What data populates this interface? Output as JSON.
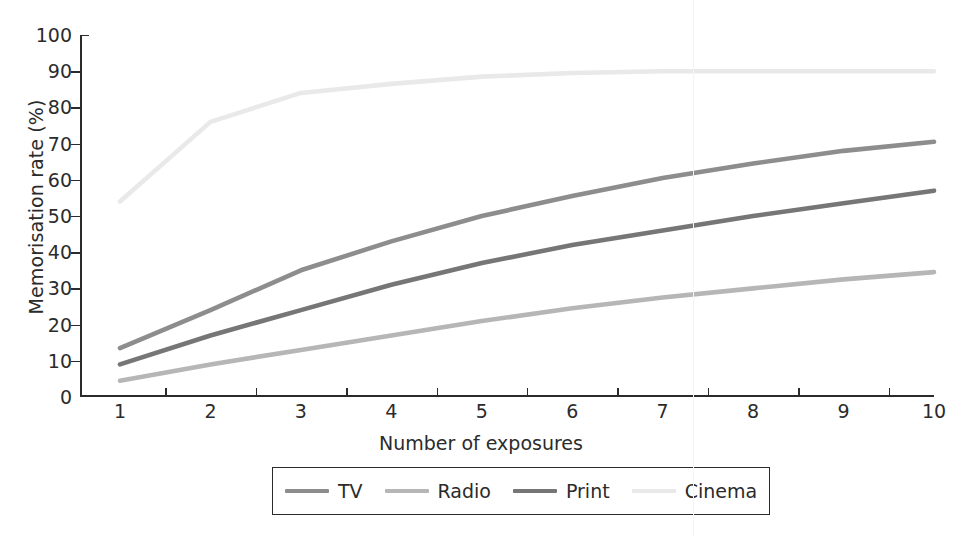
{
  "chart_data": {
    "type": "line",
    "title": "",
    "xlabel": "Number of exposures",
    "ylabel": "Memorisation rate (%)",
    "x": [
      1,
      2,
      3,
      4,
      5,
      6,
      7,
      8,
      9,
      10
    ],
    "xlim": [
      1,
      10
    ],
    "ylim": [
      0,
      100
    ],
    "x_ticks": [
      "1",
      "2",
      "3",
      "4",
      "5",
      "6",
      "7",
      "8",
      "9",
      "10"
    ],
    "y_ticks": [
      "0",
      "10",
      "20",
      "30",
      "40",
      "50",
      "60",
      "70",
      "80",
      "90",
      "100"
    ],
    "grid": false,
    "legend_position": "bottom",
    "series": [
      {
        "name": "TV",
        "color": "#8d8d8d",
        "values": [
          13.5,
          24,
          35,
          43,
          50,
          55.5,
          60.5,
          64.5,
          68,
          70.5
        ]
      },
      {
        "name": "Radio",
        "color": "#b6b6b6",
        "values": [
          4.5,
          9,
          13,
          17,
          21,
          24.5,
          27.5,
          30,
          32.5,
          34.5
        ]
      },
      {
        "name": "Print",
        "color": "#767676",
        "values": [
          9,
          17,
          24,
          31,
          37,
          42,
          46,
          50,
          53.5,
          57
        ]
      },
      {
        "name": "Cinema",
        "color": "#e9e9e9",
        "values": [
          54,
          76,
          84,
          86.5,
          88.5,
          89.5,
          90,
          90,
          90,
          90
        ]
      }
    ]
  },
  "axes": {
    "y_title": "Memorisation rate (%)",
    "x_title": "Number of exposures"
  },
  "legend": {
    "items": [
      {
        "label": "TV",
        "color": "#8d8d8d"
      },
      {
        "label": "Radio",
        "color": "#b6b6b6"
      },
      {
        "label": "Print",
        "color": "#767676"
      },
      {
        "label": "Cinema",
        "color": "#e9e9e9"
      }
    ]
  }
}
